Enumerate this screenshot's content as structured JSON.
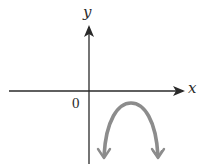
{
  "diagram": {
    "type": "coordinate-plane-sketch",
    "axes": {
      "x_label": "x",
      "y_label": "y",
      "origin_label": "0"
    },
    "curve": {
      "description": "downward-opening parabola located in quadrant IV, vertex below x-axis to the right of y-axis, both ends with arrows pointing downward",
      "color": "#8c8c8c"
    },
    "colors": {
      "axes": "#2a2a2a",
      "curve": "#8c8c8c",
      "background": "#ffffff"
    }
  }
}
